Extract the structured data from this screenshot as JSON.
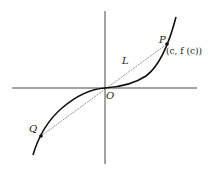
{
  "diagram": {
    "type": "function-graph",
    "labels": {
      "origin": "O",
      "point_p": "P",
      "point_q": "Q",
      "line": "L",
      "p_coordinates": "(c, f (c))"
    },
    "colors": {
      "curve": "#111111",
      "axes": "#333333",
      "secant": "#666666",
      "background": "#ffffff"
    }
  }
}
